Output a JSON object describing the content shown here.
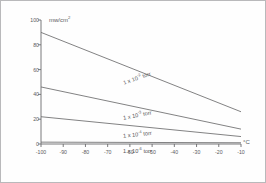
{
  "figure": {
    "border": true,
    "line_color": "#6b6b6d",
    "axis_color": "#6b6b6d",
    "text_color": "#58585a"
  },
  "chart_data": {
    "type": "line",
    "title": "",
    "subtitle": "",
    "xlabel": "°C",
    "ylabel": "mw/cm",
    "ylabel_exponent": "2",
    "ylabel_full": "mw/cm²",
    "xlim": [
      -100,
      -10
    ],
    "ylim": [
      0,
      100
    ],
    "grid": false,
    "legend": "inline-curve-labels",
    "x_ticks": [
      -100,
      -90,
      -80,
      -70,
      -60,
      -50,
      -40,
      -30,
      -20,
      -10
    ],
    "x_tick_labels": [
      "-100",
      "-90",
      "-80",
      "-70",
      "-60",
      "-50",
      "-40",
      "-30",
      "-20",
      "-10"
    ],
    "y_ticks": [
      0,
      20,
      40,
      60,
      80,
      100
    ],
    "y_tick_labels": [
      "0",
      "20",
      "40",
      "60",
      "80",
      "100"
    ],
    "series": [
      {
        "name": "1 x 10⁻² torr",
        "label_prefix": "1 x 10",
        "label_exponent": "-2",
        "label_suffix": "torr",
        "label_rotation_deg": -19,
        "x": [
          -100,
          -10
        ],
        "values": [
          90,
          26
        ]
      },
      {
        "name": "1 x 10⁻³ torr",
        "label_prefix": "1 x 10",
        "label_exponent": "-3",
        "label_suffix": "torr",
        "label_rotation_deg": -11,
        "x": [
          -100,
          -10
        ],
        "values": [
          46,
          12
        ]
      },
      {
        "name": "1 x 10⁻⁴ torr",
        "label_prefix": "1 x 10",
        "label_exponent": "-4",
        "label_suffix": "torr",
        "label_rotation_deg": -6,
        "x": [
          -100,
          -10
        ],
        "values": [
          22,
          6
        ]
      },
      {
        "name": "1 x 10⁻⁶ torr",
        "label_prefix": "1 x 10",
        "label_exponent": "-6",
        "label_suffix": "torr",
        "label_rotation_deg": 0,
        "x": [
          -100,
          -10
        ],
        "values": [
          1.5,
          1.0
        ]
      }
    ]
  }
}
